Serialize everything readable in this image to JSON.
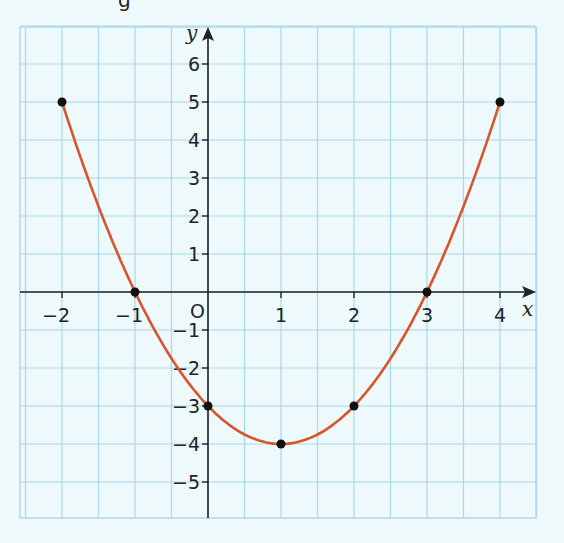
{
  "header": {
    "cropped_text": "g"
  },
  "colors": {
    "background": "#eef9fc",
    "grid": "#a8d8ec",
    "axis": "#222222",
    "curve": "#d9532b",
    "point": "#111111"
  },
  "chart_data": {
    "type": "line",
    "title": "",
    "xlabel": "x",
    "ylabel": "y",
    "origin_label": "O",
    "xlim": [
      -2.5,
      4.5
    ],
    "ylim": [
      -6,
      7
    ],
    "x_ticks": [
      -2,
      -1,
      1,
      2,
      3,
      4
    ],
    "x_tick_labels": [
      "−2",
      "−1",
      "1",
      "2",
      "3",
      "4"
    ],
    "y_ticks": [
      6,
      5,
      4,
      3,
      2,
      1,
      -1,
      -2,
      -3,
      -4,
      -5
    ],
    "y_tick_labels": [
      "6",
      "5",
      "4",
      "3",
      "2",
      "1",
      "−1",
      "−2",
      "−3",
      "−4",
      "−5"
    ],
    "grid": true,
    "grid_step": 0.5,
    "series": [
      {
        "name": "y = x² − 2x − 3",
        "x": [
          -2,
          -1,
          0,
          1,
          2,
          3,
          4
        ],
        "y": [
          5,
          0,
          -3,
          -4,
          -3,
          0,
          5
        ]
      }
    ],
    "points": [
      [
        -2,
        5
      ],
      [
        -1,
        0
      ],
      [
        0,
        -3
      ],
      [
        1,
        -4
      ],
      [
        2,
        -3
      ],
      [
        3,
        0
      ],
      [
        4,
        5
      ]
    ]
  }
}
